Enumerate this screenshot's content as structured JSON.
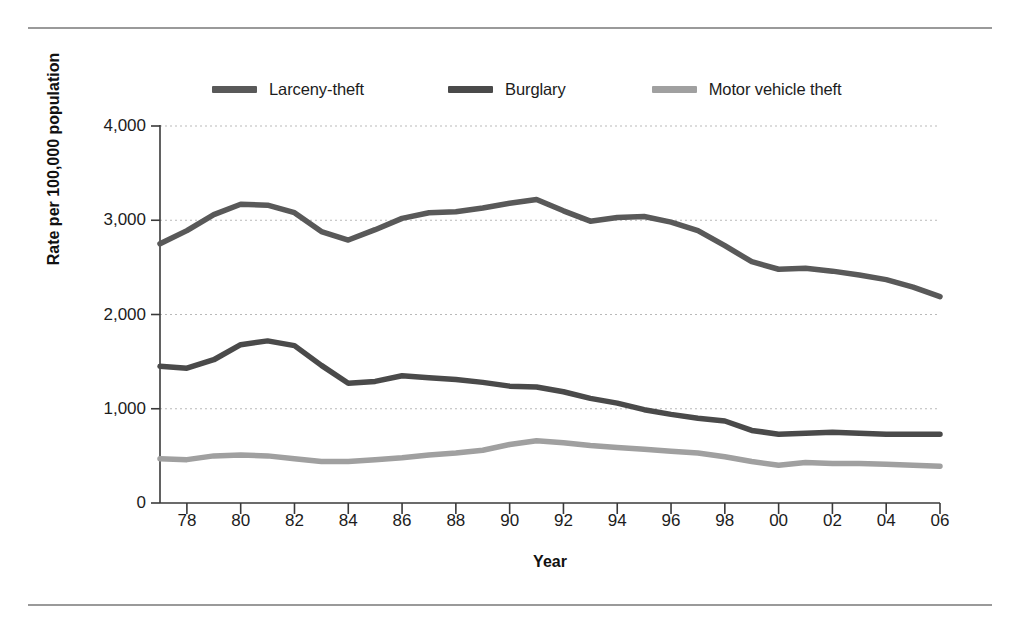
{
  "chart_data": {
    "type": "line",
    "title": "",
    "xlabel": "Year",
    "ylabel": "Rate per 100,000 population",
    "xlim": [
      1977,
      2006
    ],
    "ylim": [
      0,
      4000
    ],
    "grid": true,
    "legend_position": "top",
    "y_ticks": [
      0,
      1000,
      2000,
      3000,
      4000
    ],
    "y_tick_labels": [
      "0",
      "1,000",
      "2,000",
      "3,000",
      "4,000"
    ],
    "x_ticks": [
      1978,
      1980,
      1982,
      1984,
      1986,
      1988,
      1990,
      1992,
      1994,
      1996,
      1998,
      2000,
      2002,
      2004,
      2006
    ],
    "x_tick_labels": [
      "78",
      "80",
      "82",
      "84",
      "86",
      "88",
      "90",
      "92",
      "94",
      "96",
      "98",
      "00",
      "02",
      "04",
      "06"
    ],
    "x": [
      1977,
      1978,
      1979,
      1980,
      1981,
      1982,
      1983,
      1984,
      1985,
      1986,
      1987,
      1988,
      1989,
      1990,
      1991,
      1992,
      1993,
      1994,
      1995,
      1996,
      1997,
      1998,
      1999,
      2000,
      2001,
      2002,
      2003,
      2004,
      2005,
      2006
    ],
    "series": [
      {
        "name": "Larceny-theft",
        "color": "#595959",
        "values": [
          2750,
          2890,
          3060,
          3170,
          3160,
          3080,
          2880,
          2790,
          2900,
          3020,
          3080,
          3090,
          3130,
          3180,
          3220,
          3100,
          2990,
          3030,
          3040,
          2980,
          2890,
          2730,
          2560,
          2480,
          2490,
          2460,
          2420,
          2370,
          2290,
          2190
        ]
      },
      {
        "name": "Burglary",
        "color": "#4a4a4a",
        "values": [
          1450,
          1430,
          1520,
          1680,
          1720,
          1670,
          1460,
          1270,
          1290,
          1350,
          1330,
          1310,
          1280,
          1240,
          1230,
          1180,
          1110,
          1060,
          990,
          940,
          900,
          870,
          770,
          730,
          740,
          750,
          740,
          730,
          730,
          730
        ]
      },
      {
        "name": "Motor vehicle theft",
        "color": "#a0a0a0",
        "values": [
          470,
          460,
          500,
          510,
          500,
          470,
          440,
          440,
          460,
          480,
          510,
          530,
          560,
          620,
          660,
          640,
          610,
          590,
          570,
          550,
          530,
          490,
          440,
          400,
          430,
          420,
          420,
          410,
          400,
          390
        ]
      }
    ]
  },
  "legend": {
    "items": [
      {
        "label": "Larceny-theft",
        "color": "#595959"
      },
      {
        "label": "Burglary",
        "color": "#4a4a4a"
      },
      {
        "label": "Motor vehicle theft",
        "color": "#a0a0a0"
      }
    ]
  },
  "axes": {
    "x_title": "Year",
    "y_title": "Rate per 100,000 population"
  }
}
